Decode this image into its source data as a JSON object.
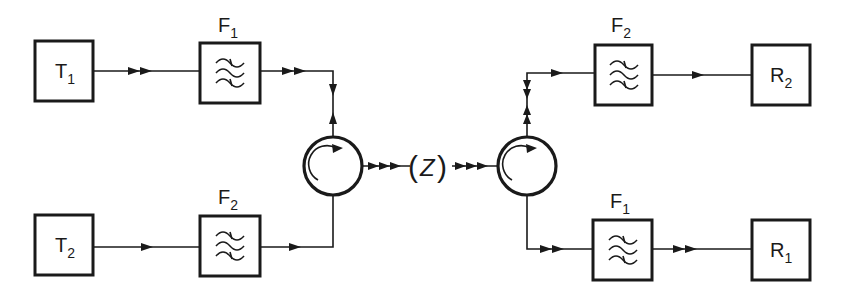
{
  "diagram": {
    "type": "duplex filter/circulator block diagram",
    "transmitters": [
      {
        "id": "T1",
        "main": "T",
        "sub": "1"
      },
      {
        "id": "T2",
        "main": "T",
        "sub": "2"
      }
    ],
    "receivers": [
      {
        "id": "R2",
        "main": "R",
        "sub": "2"
      },
      {
        "id": "R1",
        "main": "R",
        "sub": "1"
      }
    ],
    "filters": [
      {
        "id": "F1-top-left",
        "main": "F",
        "sub": "1"
      },
      {
        "id": "F2-bottom-left",
        "main": "F",
        "sub": "2"
      },
      {
        "id": "F2-top-right",
        "main": "F",
        "sub": "2"
      },
      {
        "id": "F1-bottom-right",
        "main": "F",
        "sub": "1"
      }
    ],
    "link": {
      "label": "(Z)",
      "open": "(",
      "symbol": "Z",
      "close": ")"
    },
    "colors": {
      "stroke": "#1a1a1a",
      "background": "#ffffff"
    },
    "connections": [
      "T1 -> F1 -> circulator-left",
      "T2 -> F2 -> circulator-left",
      "circulator-left -> Z -> circulator-right",
      "circulator-right -> F2 -> R2",
      "circulator-right -> F1 -> R1"
    ]
  }
}
